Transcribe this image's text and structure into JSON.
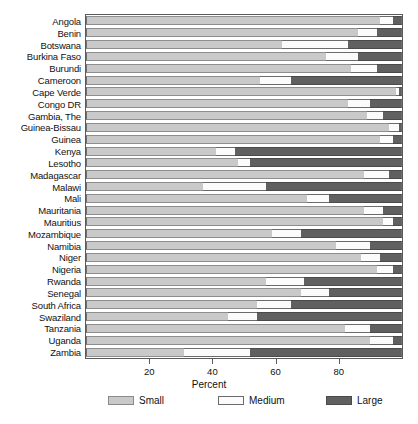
{
  "chart_data": {
    "type": "bar",
    "orientation": "horizontal",
    "stacked": true,
    "title": "",
    "xlabel": "Percent",
    "ylabel": "",
    "xlim": [
      0,
      100
    ],
    "xticks": [
      20,
      40,
      60,
      80
    ],
    "xticklabels": [
      "20",
      "40",
      "60",
      "80"
    ],
    "grid": false,
    "legend_position": "bottom",
    "categories": [
      "Angola",
      "Benin",
      "Botswana",
      "Burkina Faso",
      "Burundi",
      "Cameroon",
      "Cape Verde",
      "Congo DR",
      "Gambia, The",
      "Guinea-Bissau",
      "Guinea",
      "Kenya",
      "Lesotho",
      "Madagascar",
      "Malawi",
      "Mali",
      "Mauritania",
      "Mauritius",
      "Mozambique",
      "Namibia",
      "Niger",
      "Nigeria",
      "Rwanda",
      "Senegal",
      "South Africa",
      "Swaziland",
      "Tanzania",
      "Uganda",
      "Zambia"
    ],
    "series": [
      {
        "name": "Small",
        "color": "#c9c9c9",
        "values": [
          93,
          86,
          62,
          76,
          84,
          55,
          98,
          83,
          89,
          96,
          93,
          41,
          48,
          88,
          37,
          70,
          88,
          94,
          59,
          79,
          87,
          92,
          57,
          68,
          54,
          45,
          82,
          90,
          31
        ]
      },
      {
        "name": "Medium",
        "color": "#fbfbfb",
        "values": [
          4,
          6,
          21,
          10,
          8,
          10,
          1,
          7,
          5,
          3,
          4,
          6,
          4,
          8,
          20,
          7,
          6,
          3,
          9,
          11,
          6,
          5,
          12,
          9,
          11,
          9,
          8,
          7,
          21
        ]
      },
      {
        "name": "Large",
        "color": "#606060",
        "values": [
          3,
          8,
          17,
          14,
          8,
          35,
          1,
          10,
          6,
          1,
          3,
          53,
          48,
          4,
          43,
          23,
          6,
          3,
          32,
          10,
          7,
          3,
          31,
          23,
          35,
          46,
          10,
          3,
          48
        ]
      }
    ]
  },
  "axis": {
    "xlabel": "Percent"
  },
  "legend": {
    "items": [
      {
        "label": "Small",
        "color": "#c9c9c9"
      },
      {
        "label": "Medium",
        "color": "#fbfbfb"
      },
      {
        "label": "Large",
        "color": "#606060"
      }
    ]
  }
}
